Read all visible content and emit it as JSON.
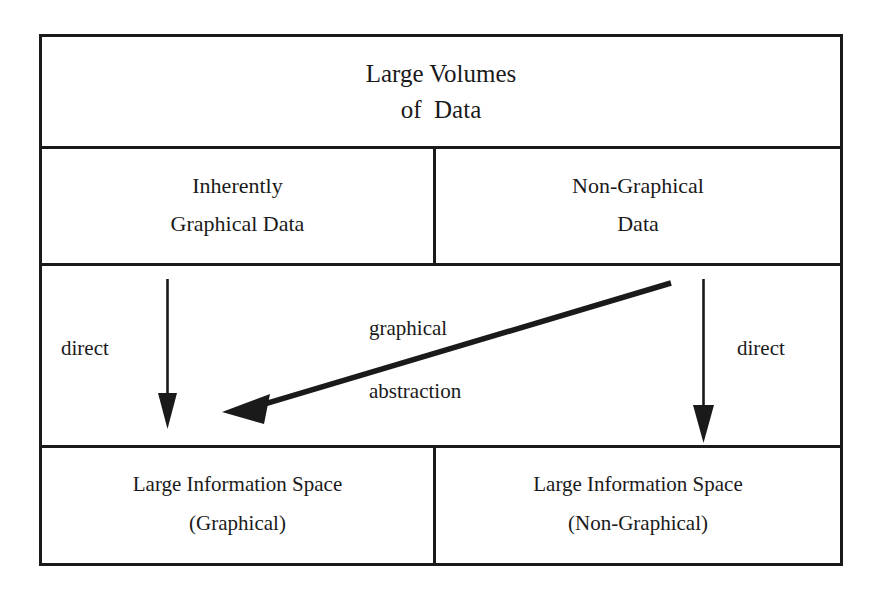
{
  "diagram": {
    "title_box": {
      "lines": [
        "Large Volumes",
        "of  Data"
      ]
    },
    "row_sources": [
      {
        "lines": [
          "Inherently",
          "Graphical Data"
        ]
      },
      {
        "lines": [
          "Non-Graphical",
          "Data"
        ]
      }
    ],
    "row_targets": [
      {
        "lines": [
          "Large Information Space",
          "(Graphical)"
        ]
      },
      {
        "lines": [
          "Large Information Space",
          "(Non-Graphical)"
        ]
      }
    ],
    "edges": {
      "direct_left": "direct",
      "direct_right": "direct",
      "abstraction_upper": "graphical",
      "abstraction_lower": "abstraction"
    },
    "colors": {
      "ink": "#1a1a1a",
      "paper": "#ffffff"
    }
  }
}
